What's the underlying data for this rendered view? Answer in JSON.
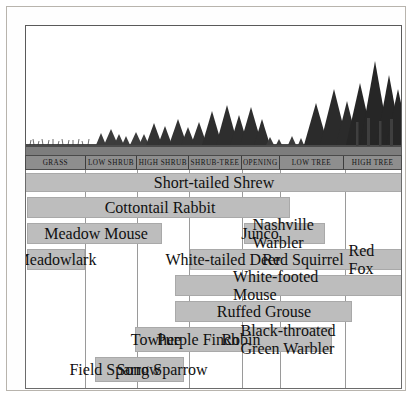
{
  "figure": {
    "illustration_name": "forest-succession-profile"
  },
  "zones": {
    "header_labels": [
      "GRASS",
      "LOW SHRUB",
      "HIGH SHRUB",
      "SHRUB-TREE",
      "OPENING",
      "LOW TREE",
      "HIGH TREE"
    ],
    "boundaries_px": [
      18,
      78,
      130,
      182,
      235,
      273,
      338,
      395
    ]
  },
  "colors": {
    "band_fill": "#bdbdbd",
    "band_stroke": "#a9a9a9",
    "header_fill": "#8e8e8e",
    "grid_line": "#9a9a9a",
    "frame": "#b8b4ad",
    "text": "#101010"
  },
  "chart_data": {
    "type": "bar",
    "xlabel": "",
    "ylabel": "",
    "categories": [
      "GRASS",
      "LOW SHRUB",
      "HIGH SHRUB",
      "SHRUB-TREE",
      "OPENING",
      "LOW TREE",
      "HIGH TREE"
    ],
    "orientation": "horizontal-range",
    "rows": [
      {
        "row": 1,
        "segments": [
          {
            "label": "Short-tailed Shrew",
            "x_start": 18,
            "x_end": 395,
            "label_x": 206
          }
        ]
      },
      {
        "row": 2,
        "segments": [
          {
            "label": "Cottontail Rabbit",
            "x_start": 20,
            "x_end": 283,
            "label_x": 152
          }
        ]
      },
      {
        "row": 3,
        "segments": [
          {
            "label": "Meadow Mouse",
            "x_start": 20,
            "x_end": 155,
            "label_x": 88
          },
          {
            "label": "Junco",
            "x_start": 237,
            "x_end": 318,
            "label_x": 252
          },
          {
            "label": "Nashville\nWarbler",
            "x_start": 237,
            "x_end": 318,
            "label_x": 294
          }
        ]
      },
      {
        "row": 4,
        "segments": [
          {
            "label": "Meadowlark",
            "x_start": 20,
            "x_end": 78,
            "label_x": 48
          },
          {
            "label": "White-tailed Deer",
            "x_start": 183,
            "x_end": 395,
            "label_x": 215
          },
          {
            "label": "Red Squirrel",
            "x_start": 183,
            "x_end": 395,
            "label_x": 295
          },
          {
            "label": "Red Fox",
            "x_start": 183,
            "x_end": 395,
            "label_x": 358
          }
        ]
      },
      {
        "row": 5,
        "segments": [
          {
            "label": "White-footed Mouse",
            "x_start": 168,
            "x_end": 395,
            "label_x": 281
          }
        ]
      },
      {
        "row": 6,
        "segments": [
          {
            "label": "Ruffed Grouse",
            "x_start": 168,
            "x_end": 345,
            "label_x": 256
          }
        ]
      },
      {
        "row": 7,
        "segments": [
          {
            "label": "Towhee",
            "x_start": 128,
            "x_end": 325,
            "label_x": 148
          },
          {
            "label": "Purple\nFinch",
            "x_start": 128,
            "x_end": 325,
            "label_x": 190
          },
          {
            "label": "Robin",
            "x_start": 128,
            "x_end": 325,
            "label_x": 233
          },
          {
            "label": "Black-throated\nGreen Warbler",
            "x_start": 128,
            "x_end": 325,
            "label_x": 286
          }
        ]
      },
      {
        "row": 8,
        "segments": [
          {
            "label": "Field\nSparrow",
            "x_start": 88,
            "x_end": 177,
            "label_x": 107
          },
          {
            "label": "Song\nSparrow",
            "x_start": 88,
            "x_end": 177,
            "label_x": 154
          }
        ]
      }
    ],
    "species": [
      "Short-tailed Shrew",
      "Cottontail Rabbit",
      "Meadow Mouse",
      "Junco",
      "Nashville Warbler",
      "Meadowlark",
      "White-tailed Deer",
      "Red Squirrel",
      "Red Fox",
      "White-footed Mouse",
      "Ruffed Grouse",
      "Towhee",
      "Purple Finch",
      "Robin",
      "Black-throated Green Warbler",
      "Field Sparrow",
      "Song Sparrow"
    ],
    "grid": true,
    "legend": "none"
  }
}
